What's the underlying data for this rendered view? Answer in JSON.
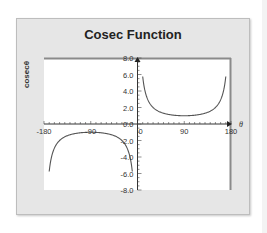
{
  "chart_data": {
    "type": "line",
    "title": "Cosec Function",
    "xlabel": "θ",
    "ylabel": "cosecθ",
    "xlim": [
      -180,
      180
    ],
    "ylim": [
      -8.0,
      8.0
    ],
    "x_ticks": [
      "-180",
      "-90",
      "0",
      "90",
      "180"
    ],
    "y_ticks": [
      "8.0",
      "6.0",
      "4.0",
      "2.0",
      "0.0",
      "-2.0",
      "-4.0",
      "-6.0",
      "-8.0"
    ],
    "grid": false,
    "legend": "none",
    "series": [
      {
        "name": "cosecθ (0 < θ < 180)",
        "x": [
          10,
          15,
          20,
          30,
          45,
          60,
          90,
          120,
          135,
          150,
          160,
          165,
          170
        ],
        "y": [
          5.76,
          3.86,
          2.92,
          2.0,
          1.41,
          1.15,
          1.0,
          1.15,
          1.41,
          2.0,
          2.92,
          3.86,
          5.76
        ]
      },
      {
        "name": "cosecθ (-180 < θ < 0)",
        "x": [
          -170,
          -165,
          -160,
          -150,
          -135,
          -120,
          -90,
          -60,
          -45,
          -30,
          -20,
          -15,
          -10
        ],
        "y": [
          -5.76,
          -3.86,
          -2.92,
          -2.0,
          -1.41,
          -1.15,
          -1.0,
          -1.15,
          -1.41,
          -2.0,
          -2.92,
          -3.86,
          -5.76
        ]
      }
    ]
  },
  "chart": {
    "title": "Cosec Function",
    "ylabel": "cosecθ",
    "xlabel": "θ"
  }
}
